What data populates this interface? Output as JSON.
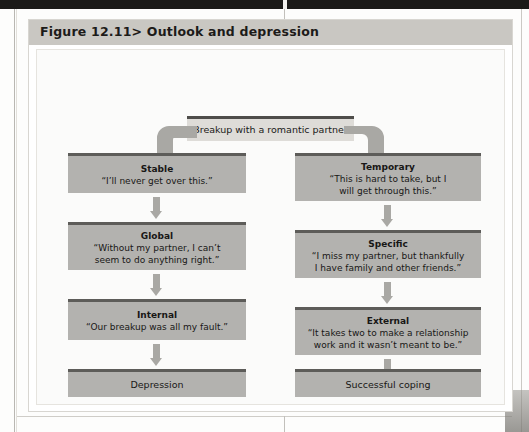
{
  "figure": {
    "label": "Figure 12.11>",
    "title": "Figure 12.11> Outlook and depression",
    "title_prefix": "Figure 12.11>",
    "title_text": "Outlook and depression"
  },
  "diagram_data": {
    "type": "flowchart",
    "root": {
      "id": "breakup",
      "label": "Breakup with a romantic partner"
    },
    "branches": [
      {
        "name": "maladaptive",
        "outcome_id": "depression",
        "nodes": [
          {
            "id": "stable",
            "title": "Stable",
            "quote": "“I’ll never get over this.”"
          },
          {
            "id": "global",
            "title": "Global",
            "quote": "“Without my partner, I can’t seem to do anything right.”"
          },
          {
            "id": "internal",
            "title": "Internal",
            "quote": "“Our breakup was all my fault.”"
          }
        ],
        "outcome": "Depression"
      },
      {
        "name": "adaptive",
        "outcome_id": "successful-coping",
        "nodes": [
          {
            "id": "temporary",
            "title": "Temporary",
            "quote": "“This is hard to take, but I will get through this.”"
          },
          {
            "id": "specific",
            "title": "Specific",
            "quote": "“I miss my partner, but thankfully I have family and other friends.”"
          },
          {
            "id": "external",
            "title": "External",
            "quote": "“It takes two to make a relationship work and it wasn’t meant to be.”"
          }
        ],
        "outcome": "Successful coping"
      }
    ],
    "colors": {
      "node_fill": "#b3b2af",
      "node_top_rule": "#5d5c59",
      "root_fill": "#dedcd8",
      "arrow": "#a9a8a4",
      "title_bar": "#c9c7c2",
      "figure_bg": "#fbfbfa"
    }
  },
  "nodes": {
    "root_label": "Breakup with a romantic partner",
    "stable_title": "Stable",
    "stable_quote": "“I’ll never get over this.”",
    "temporary_title": "Temporary",
    "temporary_quote_line1": "“This is hard to take, but I",
    "temporary_quote_line2": "will get through this.”",
    "global_title": "Global",
    "global_quote_line1": "“Without my partner, I can’t",
    "global_quote_line2": "seem to do anything right.”",
    "specific_title": "Specific",
    "specific_quote_line1": "“I miss my partner, but thankfully",
    "specific_quote_line2": "I have family and other friends.”",
    "internal_title": "Internal",
    "internal_quote": "“Our breakup was all my fault.”",
    "external_title": "External",
    "external_quote_line1": "“It takes two to make a relationship",
    "external_quote_line2": "work and it wasn’t meant to be.”",
    "depression_label": "Depression",
    "coping_label": "Successful coping"
  }
}
